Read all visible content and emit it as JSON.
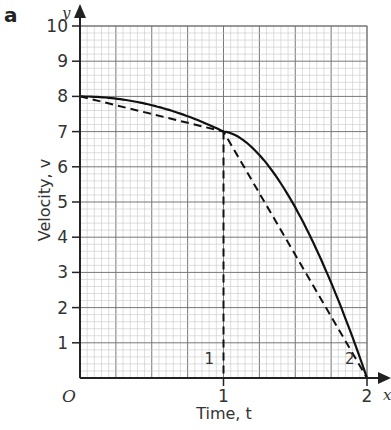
{
  "panel_label": "a",
  "chart_data": {
    "type": "line",
    "title": "",
    "xlabel": "Time, t",
    "ylabel": "Velocity, v",
    "x_axis_symbol": "x",
    "y_axis_symbol": "y",
    "origin_label": "O",
    "xlim": [
      0,
      2
    ],
    "ylim": [
      0,
      10
    ],
    "x_ticks": [
      "1",
      "2"
    ],
    "y_ticks": [
      "1",
      "2",
      "3",
      "4",
      "5",
      "6",
      "7",
      "8",
      "9",
      "10"
    ],
    "grid": true,
    "series": [
      {
        "name": "curve",
        "style": "solid",
        "x": [
          0,
          0.25,
          0.5,
          0.75,
          1.0,
          1.25,
          1.5,
          1.75,
          2.0
        ],
        "y": [
          8,
          7.94,
          7.75,
          7.44,
          7.0,
          6.44,
          5.75,
          4.94,
          0
        ]
      },
      {
        "name": "strip-1",
        "style": "dashed",
        "x": [
          0,
          1,
          1,
          1
        ],
        "y": [
          8,
          7,
          0,
          0
        ]
      },
      {
        "name": "strip-2",
        "style": "dashed",
        "x": [
          1,
          2
        ],
        "y": [
          7,
          0
        ]
      }
    ],
    "annotations": [
      {
        "text": "1",
        "x": 0.9,
        "y": 0.4
      },
      {
        "text": "2",
        "x": 1.88,
        "y": 0.4
      }
    ]
  }
}
